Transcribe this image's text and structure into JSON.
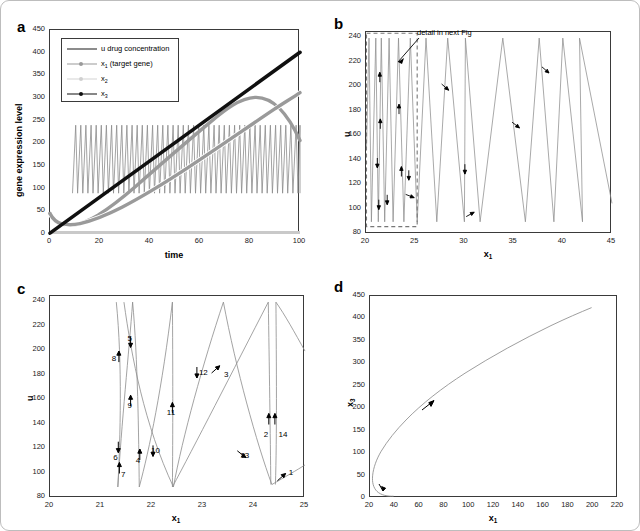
{
  "figure": {
    "background": "#ffffff",
    "border_color": "#bdbdbd"
  },
  "colors": {
    "u_curve": "#8c8c8c",
    "x1_curve": "#9a9a9a",
    "x2_curve": "#c9c9c9",
    "x3_curve": "#101010",
    "axis": "#3a3a3a",
    "dashed_box": "#777777",
    "arrow": "#000000"
  },
  "panels": [
    {
      "id": "a",
      "letter": "a",
      "xlabel": "time",
      "ylabel": "gene expression level",
      "xticks": [
        "0",
        "20",
        "40",
        "60",
        "80",
        "100"
      ],
      "yticks": [
        "0",
        "50",
        "100",
        "150",
        "200",
        "250",
        "300",
        "350",
        "400",
        "450"
      ],
      "xlim": [
        0,
        100
      ],
      "ylim": [
        0,
        450
      ],
      "legend": [
        {
          "label": "u drug concentration",
          "style": "line",
          "color": "#8c8c8c",
          "width": 2.2
        },
        {
          "label": "x₁ (target gene)",
          "style": "line-dot",
          "color": "#9a9a9a",
          "width": 1.2
        },
        {
          "label": "x₂",
          "style": "line-dot",
          "color": "#cccccc",
          "width": 1.2
        },
        {
          "label": "x₃",
          "style": "line-dot",
          "color": "#101010",
          "width": 1.6
        }
      ]
    },
    {
      "id": "b",
      "letter": "b",
      "xlabel": "x₁",
      "ylabel": "u",
      "xticks": [
        "20",
        "25",
        "30",
        "35",
        "40",
        "45"
      ],
      "yticks": [
        "80",
        "100",
        "120",
        "140",
        "160",
        "180",
        "200",
        "220",
        "240"
      ],
      "xlim": [
        20,
        45
      ],
      "ylim": [
        80,
        245
      ],
      "annotation": {
        "text": "detail in next Fig",
        "box_x_range": [
          20,
          25.15
        ],
        "box_y_range": [
          86,
          244
        ]
      }
    },
    {
      "id": "c",
      "letter": "c",
      "xlabel": "x₁",
      "ylabel": "u",
      "xticks": [
        "20",
        "21",
        "22",
        "23",
        "24",
        "25"
      ],
      "yticks": [
        "80",
        "100",
        "120",
        "140",
        "160",
        "180",
        "200",
        "220",
        "240"
      ],
      "xlim": [
        20,
        25
      ],
      "ylim": [
        80,
        245
      ],
      "arrow_labels": [
        {
          "n": "1",
          "x": 24.7,
          "y": 103,
          "ax": 24.62,
          "ay": 100,
          "dir": "upright"
        },
        {
          "n": "2",
          "x": 24.21,
          "y": 134,
          "ax": 24.29,
          "ay": 149,
          "dir": "up"
        },
        {
          "n": "3",
          "x": 23.43,
          "y": 183,
          "ax": 23.33,
          "ay": 188,
          "dir": "upright"
        },
        {
          "n": "4",
          "x": 21.7,
          "y": 113,
          "ax": 21.76,
          "ay": 120,
          "dir": "up"
        },
        {
          "n": "5",
          "x": 21.54,
          "y": 212,
          "ax": 21.58,
          "ay": 203,
          "dir": "down"
        },
        {
          "n": "6",
          "x": 21.26,
          "y": 115,
          "ax": 21.34,
          "ay": 117,
          "dir": "down"
        },
        {
          "n": "7",
          "x": 21.41,
          "y": 101,
          "ax": 21.36,
          "ay": 109,
          "dir": "up"
        },
        {
          "n": "8",
          "x": 21.23,
          "y": 196,
          "ax": 21.35,
          "ay": 200,
          "dir": "up"
        },
        {
          "n": "9",
          "x": 21.54,
          "y": 158,
          "ax": 21.58,
          "ay": 164,
          "dir": "up"
        },
        {
          "n": "10",
          "x": 22.0,
          "y": 121,
          "ax": 22.02,
          "ay": 114,
          "dir": "down"
        },
        {
          "n": "11",
          "x": 22.31,
          "y": 152,
          "ax": 22.4,
          "ay": 158,
          "dir": "up"
        },
        {
          "n": "12",
          "x": 22.94,
          "y": 185,
          "ax": 22.88,
          "ay": 178,
          "dir": "down"
        },
        {
          "n": "13",
          "x": 23.75,
          "y": 117,
          "ax": 23.84,
          "ay": 113,
          "dir": "downright"
        },
        {
          "n": "14",
          "x": 24.5,
          "y": 134,
          "ax": 24.41,
          "ay": 149,
          "dir": "up"
        }
      ]
    },
    {
      "id": "d",
      "letter": "d",
      "xlabel": "x₁",
      "ylabel": "x₃",
      "xticks": [
        "20",
        "40",
        "60",
        "80",
        "100",
        "120",
        "140",
        "160",
        "180",
        "200",
        "220"
      ],
      "yticks": [
        "0",
        "50",
        "100",
        "150",
        "200",
        "250",
        "300",
        "350",
        "400",
        "450"
      ],
      "xlim": [
        20,
        220
      ],
      "ylim": [
        0,
        450
      ]
    }
  ],
  "chart_data": [
    {
      "type": "line",
      "panel": "a",
      "title": "",
      "xlabel": "time",
      "ylabel": "gene expression level",
      "xlim": [
        0,
        100
      ],
      "ylim": [
        0,
        450
      ],
      "grid": false,
      "legend_position": "upper-left",
      "series": [
        {
          "name": "u drug concentration",
          "color": "#8c8c8c",
          "description": "fast sawtooth/relaxation oscillation between about 90 and 240, period ~2.0 time units, starting near t=9",
          "osc_min": 90,
          "osc_max": 240,
          "osc_period": 2.05,
          "osc_start_t": 9
        },
        {
          "name": "x1 (target gene)",
          "color": "#9a9a9a",
          "x": [
            0,
            2,
            4,
            6,
            8,
            10,
            15,
            20,
            30,
            40,
            50,
            60,
            70,
            80,
            90,
            100
          ],
          "y": [
            45,
            34,
            27,
            23,
            21,
            21,
            22,
            26,
            39,
            57,
            79,
            103,
            129,
            155,
            181,
            206
          ]
        },
        {
          "name": "x2",
          "color": "#c9c9c9",
          "x": [
            0,
            10,
            20,
            40,
            60,
            80,
            100
          ],
          "y": [
            3,
            3,
            3,
            3,
            3,
            3,
            3
          ]
        },
        {
          "name": "x3",
          "color": "#101010",
          "x": [
            0,
            10,
            20,
            40,
            60,
            80,
            100
          ],
          "y": [
            2,
            42,
            82,
            162,
            242,
            322,
            401
          ]
        }
      ]
    },
    {
      "type": "line",
      "panel": "b",
      "title": "",
      "xlabel": "x1",
      "ylabel": "u",
      "xlim": [
        20,
        45
      ],
      "ylim": [
        80,
        245
      ],
      "grid": false,
      "description": "phase-plane limit cycle trajectory of u vs x1 drifting to larger x1; each cycle is a tall narrow loop rising from ~90 to ~240 then falling; loops widen as x1 increases",
      "annotation": "detail in next Fig"
    },
    {
      "type": "line",
      "panel": "c",
      "title": "",
      "xlabel": "x1",
      "ylabel": "u",
      "xlim": [
        20,
        25
      ],
      "ylim": [
        80,
        245
      ],
      "grid": false,
      "description": "zoomed detail of panel b box (x1 from 20 to 25) with 14 numbered direction arrows along the trajectory",
      "arrow_count": 14
    },
    {
      "type": "line",
      "panel": "d",
      "title": "",
      "xlabel": "x1",
      "ylabel": "x3",
      "xlim": [
        20,
        220
      ],
      "ylim": [
        0,
        450
      ],
      "grid": false,
      "x": [
        39,
        30,
        24,
        22,
        22.5,
        25,
        32,
        45,
        65,
        90,
        120,
        150,
        180,
        205
      ],
      "y": [
        2,
        4,
        14,
        35,
        50,
        70,
        100,
        135,
        185,
        240,
        300,
        350,
        382,
        400
      ],
      "description": "x3 vs x1 trajectory: hooks back from x1~39 at x3~0, turns at x1~22, then rises nearly linearly to (205, 400); two direction arrows"
    }
  ]
}
